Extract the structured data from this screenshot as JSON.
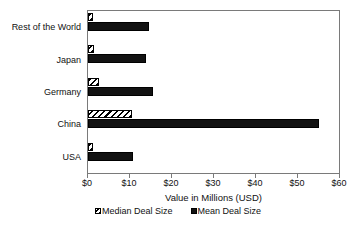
{
  "chart_data": {
    "type": "bar",
    "orientation": "horizontal",
    "title": "",
    "xlabel": "Value in Millions (USD)",
    "ylabel": "",
    "categories": [
      "Rest of the World",
      "Japan",
      "Germany",
      "China",
      "USA"
    ],
    "series": [
      {
        "name": "Median Deal Size",
        "values": [
          1.2,
          1.5,
          2.7,
          10.5,
          1.3
        ],
        "style": "hatched"
      },
      {
        "name": "Mean Deal Size",
        "values": [
          14.5,
          13.8,
          15.5,
          55.0,
          10.7
        ],
        "style": "solid"
      }
    ],
    "xlim": [
      0,
      60
    ],
    "xticks": [
      0,
      10,
      20,
      30,
      40,
      50,
      60
    ],
    "xtick_labels": [
      "$0",
      "$10",
      "$20",
      "$30",
      "$40",
      "$50",
      "$60"
    ],
    "grid": false,
    "legend_position": "bottom"
  },
  "colors": {
    "mean_fill": "#121212",
    "median_fill": "#ffffff",
    "outline": "#000000",
    "frame": "#7a7a7a",
    "background": "#ffffff"
  },
  "axis": {
    "label": "Value in Millions (USD)"
  },
  "legend": {
    "items": [
      {
        "label": "Median Deal Size",
        "swatch": "hatched-square-icon"
      },
      {
        "label": "Mean Deal Size",
        "swatch": "solid-square-icon"
      }
    ]
  }
}
